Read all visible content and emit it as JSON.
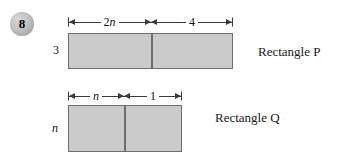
{
  "question": {
    "number": "8"
  },
  "figures": [
    {
      "id": "rectangle-p",
      "caption": "Rectangle P",
      "side_label": "3",
      "side_label_italic": false,
      "segments": [
        {
          "label_prefix": "2",
          "label_var": "n",
          "label_suffix": ""
        },
        {
          "label_prefix": "4",
          "label_var": "",
          "label_suffix": ""
        }
      ]
    },
    {
      "id": "rectangle-q",
      "caption": "Rectangle Q",
      "side_label": "n",
      "side_label_italic": true,
      "segments": [
        {
          "label_prefix": "",
          "label_var": "n",
          "label_suffix": ""
        },
        {
          "label_prefix": "1",
          "label_var": "",
          "label_suffix": ""
        }
      ]
    }
  ],
  "style": {
    "rect_fill": "#cbcbcb",
    "rect_stroke": "#6e6e6e",
    "badge_fill": "#bfbfbf",
    "line_color": "#3a3a3a",
    "background": "#ffffff"
  }
}
